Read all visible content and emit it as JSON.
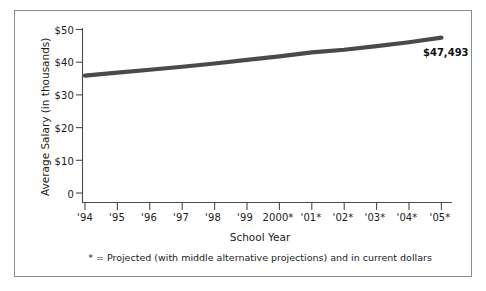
{
  "chart_data": {
    "type": "line",
    "title": "",
    "xlabel": "School Year",
    "ylabel": "Average Salary (in thousands)",
    "ylim": [
      0,
      50
    ],
    "ytick_values": [
      0,
      10,
      20,
      30,
      40,
      50
    ],
    "ytick_labels": [
      "0",
      "$10",
      "$20",
      "$30",
      "$40",
      "$50"
    ],
    "grid": false,
    "legend": "none",
    "categories": [
      "'94",
      "'95",
      "'96",
      "'97",
      "'98",
      "'99",
      "2000*",
      "'01*",
      "'02*",
      "'03*",
      "'04*",
      "'05*"
    ],
    "series": [
      {
        "name": "Average Salary",
        "values": [
          35.9,
          36.8,
          37.7,
          38.6,
          39.6,
          40.7,
          41.8,
          43.0,
          43.8,
          44.9,
          46.1,
          47.493
        ]
      }
    ],
    "annotations": [
      {
        "name": "endpoint-value-label",
        "text": "$47,493",
        "at_category": "'05*",
        "value": 47.493
      }
    ],
    "footnote": "* = Projected (with middle alternative projections) and in current dollars",
    "colors": {
      "line": "#4a4a4a",
      "axis": "#4a4a4a",
      "text": "#1c1c1c",
      "frame": "#8b8b8b",
      "background": "#ffffff"
    }
  }
}
